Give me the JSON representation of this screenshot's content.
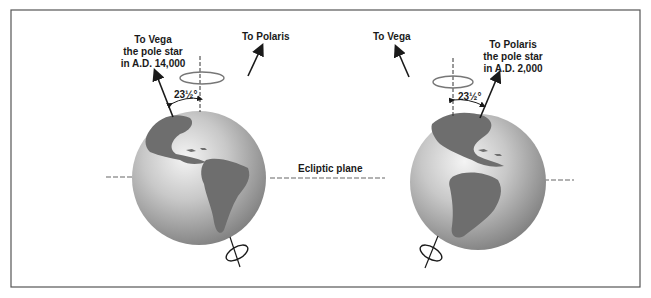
{
  "diagram": {
    "type": "precession-of-earth-axis",
    "frame_color": "#555555",
    "globe_colors": {
      "ocean_light": "#eeeeee",
      "ocean_dark": "#8a8a8a",
      "land": "#6e6e6e"
    },
    "left": {
      "vega_label_line1": "To Vega",
      "vega_label_line2": "the pole star",
      "vega_label_line3": "in A.D. 14,000",
      "polaris_label": "To Polaris",
      "tilt_angle": "23½°"
    },
    "right": {
      "vega_label": "To Vega",
      "polaris_label_line1": "To Polaris",
      "polaris_label_line2": "the pole star",
      "polaris_label_line3": "in A.D. 2,000",
      "tilt_angle": "23½°"
    },
    "ecliptic_label": "Ecliptic plane"
  }
}
